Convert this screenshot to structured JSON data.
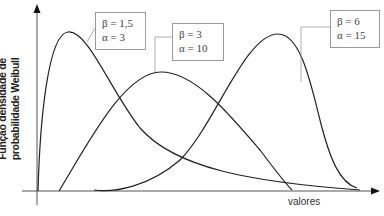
{
  "chart_data": {
    "type": "line",
    "title": "",
    "xlabel": "valores",
    "ylabel": "Função densidade de probabilidade Weibull",
    "ylabel_lines": [
      "Função densidade de",
      "probabilidade Weibull"
    ],
    "grid": false,
    "axis_ticks": false,
    "legend_position": "callout boxes near each curve peak",
    "series": [
      {
        "name": "β = 1,5  α = 3",
        "beta_label": "β = 1,5",
        "alpha_label": "α = 3",
        "beta": 1.5,
        "alpha": 3,
        "shape": "right-skewed, early sharp peak, long tail",
        "path": "M38,191 C40,120 48,34 68,32 C88,30 110,90 140,128 C175,168 250,182 360,190"
      },
      {
        "name": "β = 3  α = 10",
        "beta_label": "β = 3",
        "alpha_label": "α = 10",
        "beta": 3,
        "alpha": 10,
        "shape": "moderately symmetric, mid peak",
        "path": "M59,191 C90,140 125,72 161,72 C195,72 230,115 260,150 C275,170 285,183 292,190"
      },
      {
        "name": "β = 6  α = 15",
        "beta_label": "β = 6",
        "alpha_label": "α = 15",
        "beta": 6,
        "alpha": 15,
        "shape": "left-skewed, late tall peak, sharp drop",
        "path": "M94,190 C115,193 150,186 180,160 C215,125 245,34 278,34 C300,34 310,80 320,120 C330,160 340,183 357,188"
      }
    ]
  },
  "legend": [
    {
      "beta": "β = 1,5",
      "alpha": "α = 3"
    },
    {
      "beta": "β = 3",
      "alpha": "α = 10"
    },
    {
      "beta": "β = 6",
      "alpha": "α = 15"
    }
  ],
  "axes": {
    "x_label": "valores",
    "y_label_line1": "Função densidade de",
    "y_label_line2": "probabilidade Weibull"
  },
  "colors": {
    "curve": "#222222",
    "axis": "#555555",
    "box_border": "#9a9a9a",
    "leader": "#9a9a9a"
  }
}
